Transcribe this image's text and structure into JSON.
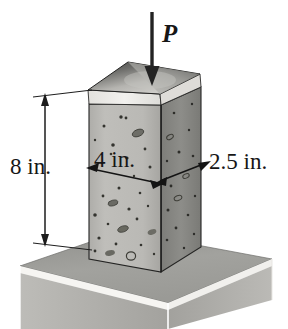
{
  "figure": {
    "labels": {
      "height": "8 in.",
      "width": "4 in.",
      "depth": "2.5 in.",
      "load": "P"
    },
    "dimensions": {
      "height_value": 8,
      "width_value": 4,
      "depth_value": 2.5,
      "units": "in."
    },
    "colors": {
      "front_face": "#b9b8b4",
      "right_face": "#8a8a86",
      "top_face_dark": "#4a4a48",
      "top_face_light": "#cfcecb",
      "chamfer": "#eceae6",
      "slab_top": "#9d9d99",
      "slab_edge": "#f4f3f0",
      "slab_front": "#a8a7a3",
      "slab_side": "#8e8e8a",
      "outline": "#1c1c1c",
      "speckle": "#3a3a38",
      "background": "#ffffff"
    },
    "parts": {
      "column": "concrete-column",
      "slab": "base-slab",
      "load_arrow": "load-arrow",
      "height_dimension": "height-dimension-line",
      "width_dimension": "width-dimension-line",
      "depth_dimension": "depth-dimension-line"
    }
  }
}
